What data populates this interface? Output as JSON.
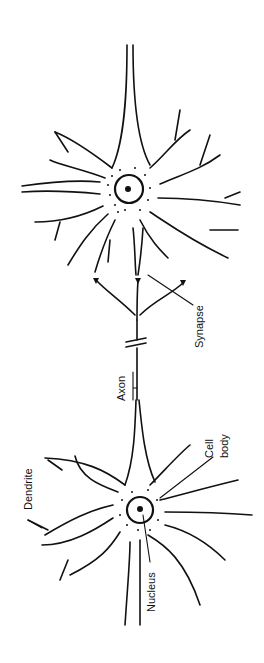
{
  "diagram": {
    "type": "neuron",
    "orientation": "rotated-90-ccw",
    "labels": {
      "dendrite": "Dendrite",
      "nucleus": "Nucleus",
      "cell_body": [
        "Cell",
        "body"
      ],
      "axon": "Axon",
      "synapse": "Synapse"
    },
    "colors": {
      "ink": "#111111",
      "background": "#ffffff"
    }
  }
}
